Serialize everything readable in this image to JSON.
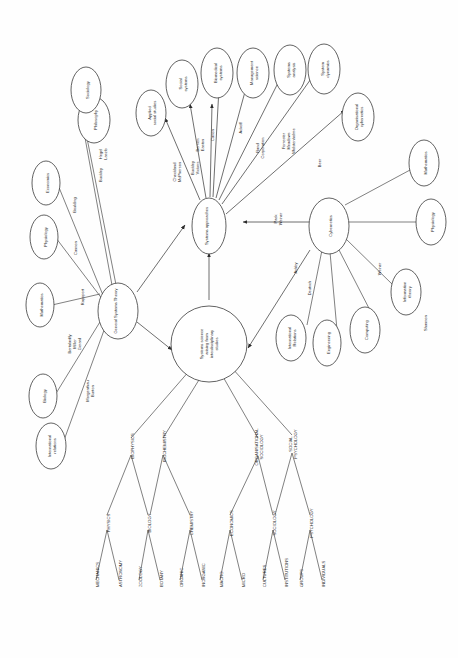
{
  "diagram": {
    "title": "Systems science arising from interdisciplinary studies",
    "orientation": "rotated-90-ccw",
    "stroke_color": "#3a3a3a",
    "background_color": "#ffffff"
  },
  "hubs": {
    "gst": "General Systems Theory",
    "sys_app": "Systems approaches",
    "sys_sci": "Systems science arising from interdisciplinary studies",
    "cybernetics": "Cybernetics"
  },
  "gst_sources": [
    {
      "node": "Philosophy",
      "edge": "Hegel\nLaszlo"
    },
    {
      "node": "Sociology",
      "edge": "Buckley"
    },
    {
      "node": "Economics",
      "edge": "Boulding"
    },
    {
      "node": "Physiology",
      "edge": "Cannon"
    },
    {
      "node": "Mathematics",
      "edge": "Rapoport"
    },
    {
      "node": "Biology",
      "edge": "Bertalanffy\nMiller\nGerard"
    },
    {
      "node": "International\nrelations",
      "edge": "Morgenthau\nBurton"
    }
  ],
  "sys_app_targets": [
    {
      "node": "Applied\nsocial studies",
      "edge": "Checkland\nMcPherson"
    },
    {
      "node": "Social\nsystems",
      "edge": "Buckley\nVickers"
    },
    {
      "node": "Social\nsystems ",
      "edge": "Berrien\nEaston"
    },
    {
      "node": "Biomedical\nsystems",
      "edge": "Canon"
    },
    {
      "node": "Management\nscience",
      "edge": "Ackoff"
    },
    {
      "node": "Systems\nanalysis",
      "edge": "Rand\nCorporation"
    },
    {
      "node": "System\ndynamics",
      "edge": "Forrester\nMeadows\nWolstenholme"
    },
    {
      "node": "Organisational\ncybernetics",
      "edge": "Beer"
    }
  ],
  "cyb_sources": [
    {
      "node": "Mathematics",
      "edge": ""
    },
    {
      "node": "Physiology",
      "edge": ""
    },
    {
      "node": "Information\ntheory",
      "edge": "Weiner"
    },
    {
      "node": "Computing",
      "edge": ""
    },
    {
      "node": "Engineering",
      "edge": ""
    },
    {
      "node": "International\nRelations",
      "edge": "Deutsch"
    }
  ],
  "cyb_to_sysapp_edge": "Pask\nWeiner",
  "cyb_to_syssci_edge": "Ashby",
  "free_labels": [
    "Shannon"
  ],
  "tree": [
    {
      "name": "BIOPHYSICS",
      "children": [
        {
          "name": "PHYSICS",
          "leaves": [
            "MECHANICS",
            "ASTRONOMY"
          ]
        },
        {
          "name": "BIOLOGY",
          "leaves": [
            "ZOOLOGY",
            "BOTANY"
          ]
        }
      ]
    },
    {
      "name": "BIOCHEMISTRY",
      "children": [
        {
          "name": "CHEMISTRY",
          "leaves": [
            "ORGANIC",
            "INORGANIC"
          ]
        }
      ]
    },
    {
      "name": "ORGANISATIONAL\nSOCIOLOGY",
      "children": [
        {
          "name": "ECONOMICS",
          "leaves": [
            "MACRO",
            "MICRO"
          ]
        },
        {
          "name": "SOCIOLOGY",
          "leaves": [
            "CULTURES",
            "INSTITUTIONS"
          ]
        }
      ]
    },
    {
      "name": "SOCIAL\nPSYCHOLOGY",
      "children": [
        {
          "name": "PSYCHOLOGY",
          "leaves": [
            "GROUPS",
            "INDIVIDUALS"
          ]
        }
      ]
    }
  ],
  "tree_flat": {
    "level1": [
      "BIOPHYSICS",
      "BIOCHEMISTRY",
      "ORGANISATIONAL SOCIOLOGY",
      "SOCIAL PSYCHOLOGY"
    ],
    "level2": [
      "PHYSICS",
      "BIOLOGY",
      "CHEMISTRY",
      "ECONOMICS",
      "SOCIOLOGY",
      "PSYCHOLOGY"
    ],
    "level3": [
      "MECHANICS",
      "ASTRONOMY",
      "ZOOLOGY",
      "BOTANY",
      "ORGANIC",
      "INORGANIC",
      "MACRO",
      "MICRO",
      "CULTURES",
      "INSTITUTIONS",
      "GROUPS",
      "INDIVIDUALS"
    ]
  }
}
